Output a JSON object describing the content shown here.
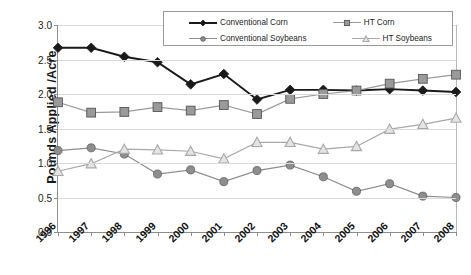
{
  "chart_data": {
    "type": "line",
    "title": "",
    "xlabel": "",
    "ylabel": "Pounds Applied /Acre",
    "categories": [
      "1996",
      "1997",
      "1998",
      "1999",
      "2000",
      "2001",
      "2002",
      "2003",
      "2004",
      "2005",
      "2006",
      "2007",
      "2008"
    ],
    "ylim": [
      0.0,
      3.0
    ],
    "y_ticks": [
      "0.0",
      "0.5",
      "1.0",
      "1.5",
      "2.0",
      "2.5",
      "3.0"
    ],
    "y_tick_values": [
      0.0,
      0.5,
      1.0,
      1.5,
      2.0,
      2.5,
      3.0
    ],
    "grid": true,
    "legend_position": "top-center",
    "series": [
      {
        "name": "Conventional Corn",
        "marker": "diamond",
        "color": "#1a1a1a",
        "values": [
          2.67,
          2.67,
          2.54,
          2.46,
          2.14,
          2.29,
          1.92,
          2.06,
          2.06,
          2.05,
          2.07,
          2.05,
          2.03
        ]
      },
      {
        "name": "HT Corn",
        "marker": "square",
        "color": "#9a9a9a",
        "values": [
          1.88,
          1.73,
          1.74,
          1.81,
          1.76,
          1.84,
          1.71,
          1.93,
          2.0,
          2.05,
          2.15,
          2.22,
          2.28
        ]
      },
      {
        "name": "Conventional Soybeans",
        "marker": "circle",
        "color": "#8e8e8e",
        "values": [
          1.18,
          1.22,
          1.13,
          0.84,
          0.9,
          0.73,
          0.89,
          0.97,
          0.8,
          0.59,
          0.7,
          0.52,
          0.5
        ]
      },
      {
        "name": "HT Soybeans",
        "marker": "triangle",
        "color": "#a8a8a8",
        "values": [
          0.88,
          0.99,
          1.2,
          1.19,
          1.17,
          1.06,
          1.3,
          1.3,
          1.2,
          1.24,
          1.49,
          1.56,
          1.65
        ]
      }
    ]
  },
  "legend": {
    "entries": [
      {
        "label": "Conventional Corn"
      },
      {
        "label": "HT Corn"
      },
      {
        "label": "Conventional Soybeans"
      },
      {
        "label": "HT Soybeans"
      }
    ]
  },
  "axis": {
    "y_title": "Pounds Applied /Acre"
  }
}
